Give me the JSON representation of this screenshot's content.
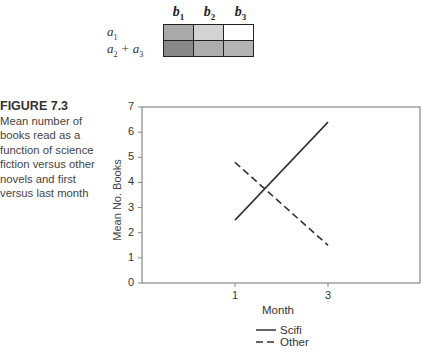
{
  "design_table": {
    "columns": [
      "b",
      "b",
      "b"
    ],
    "column_subscripts": [
      "1",
      "2",
      "3"
    ],
    "rows": [
      {
        "label": "a",
        "label_sub": "1",
        "label_rest": "",
        "label_rest_sub": "",
        "cell_colors": [
          "#a9a9a9",
          "#d3d3d3",
          "#ffffff"
        ]
      },
      {
        "label": "a",
        "label_sub": "2",
        "label_rest": " + a",
        "label_rest_sub": "3",
        "cell_colors": [
          "#888888",
          "#adadad",
          "#b3b3b3"
        ]
      }
    ]
  },
  "figure": {
    "title": "FIGURE 7.3",
    "caption": "Mean number of books read as a function of science fiction versus other novels and first versus last month"
  },
  "chart_data": {
    "type": "line",
    "title": "",
    "xlabel": "Month",
    "ylabel": "Mean No. Books",
    "x": [
      1,
      3
    ],
    "x_tick_labels": [
      "1",
      "3"
    ],
    "y_tick_labels": [
      "0",
      "1",
      "2",
      "3",
      "4",
      "5",
      "6",
      "7"
    ],
    "ylim": [
      0,
      7
    ],
    "grid": false,
    "legend_position": "below",
    "series": [
      {
        "name": "Scifi",
        "style": "solid",
        "values": [
          2.5,
          6.4
        ]
      },
      {
        "name": "Other",
        "style": "dashed",
        "values": [
          4.8,
          1.5
        ]
      }
    ]
  }
}
